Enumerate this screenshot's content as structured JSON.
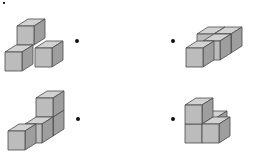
{
  "diagram": {
    "type": "isometric cube figures",
    "colors": {
      "top": "#d2d2d2",
      "front": "#bcbcbc",
      "side": "#9e9e9e",
      "edge": "#4a4a4a",
      "dot": "#111111"
    },
    "figures": [
      {
        "id": "figure-1",
        "position": "top-left",
        "cube_count": 3,
        "description": "Two cubes side by side with one cube stacked on top behind them"
      },
      {
        "id": "figure-2",
        "position": "top-right",
        "cube_count": 4,
        "description": "Four cubes in an L-shaped single layer"
      },
      {
        "id": "figure-3",
        "position": "bottom-left",
        "cube_count": 4,
        "description": "Row of three cubes with one cube stacked on the back end"
      },
      {
        "id": "figure-4",
        "position": "bottom-right",
        "cube_count": 4,
        "description": "Two-cube column with cubes beside and behind at base level"
      }
    ],
    "match_dots": [
      {
        "id": "dot-1",
        "x": 77,
        "y": 41
      },
      {
        "id": "dot-2",
        "x": 173,
        "y": 41
      },
      {
        "id": "dot-3",
        "x": 78,
        "y": 119
      },
      {
        "id": "dot-4",
        "x": 173,
        "y": 119
      }
    ]
  }
}
